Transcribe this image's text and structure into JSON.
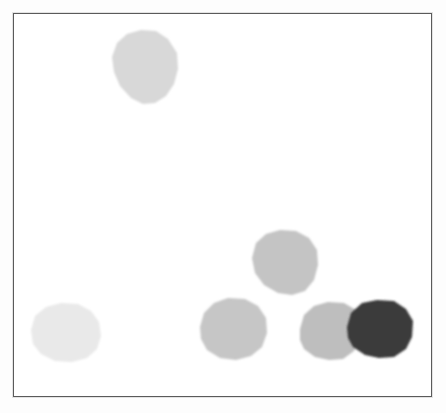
{
  "figure": {
    "type": "scanned-grayscale-particle-figure",
    "canvas": {
      "width": 446,
      "height": 413,
      "background": "#ffffff"
    },
    "frame": {
      "name": "plot-border",
      "x": 13,
      "y": 13,
      "width": 419,
      "height": 384,
      "border_color": "#5a5a5a",
      "border_width_px": 1.5,
      "fill": "#ffffff"
    },
    "palette": {
      "lightest": "#eaeaea",
      "light": "#d9d9d9",
      "medium_light": "#cfcfcf",
      "medium": "#c4c4c4",
      "dark": "#3a3a3a",
      "frame": "#5a5a5a",
      "paper": "#fdfdfd"
    }
  },
  "chart_data": {
    "type": "scatter",
    "title": "",
    "subtitle": "",
    "xlabel": "",
    "ylabel": "",
    "grid": false,
    "legend": null,
    "axis_ticks": [],
    "annotations": [],
    "xlim": [
      13,
      432
    ],
    "ylim": [
      13,
      397
    ],
    "objects": [
      {
        "id": "particle-1",
        "label": "top-light-particle",
        "cx": 145,
        "cy": 67,
        "rx": 34,
        "ry": 37,
        "gray_value": 216,
        "color": "#d8d8d8",
        "points": "112,57 117,43 127,34 141,30 156,31 168,39 177,53 178,69 174,84 166,96 155,103 143,104 131,98 120,86 114,72"
      },
      {
        "id": "particle-2",
        "label": "bottom-left-lightest-particle",
        "cx": 66,
        "cy": 332,
        "rx": 35,
        "ry": 30,
        "gray_value": 233,
        "color": "#e9e9e9",
        "points": "31,330 35,316 46,307 61,303 78,304 91,311 99,322 101,336 97,349 87,358 72,362 55,361 41,354 33,344"
      },
      {
        "id": "particle-3",
        "label": "upper-middle-gray-particle",
        "cx": 285,
        "cy": 262,
        "rx": 33,
        "ry": 33,
        "gray_value": 196,
        "color": "#c4c4c4",
        "points": "252,258 256,243 266,234 280,230 296,231 309,238 317,250 318,265 314,280 305,291 292,295 278,293 264,285 255,273"
      },
      {
        "id": "particle-4",
        "label": "lower-middle-gray-particle",
        "cx": 233,
        "cy": 329,
        "rx": 33,
        "ry": 31,
        "gray_value": 198,
        "color": "#c6c6c6",
        "points": "200,327 204,313 214,303 228,298 245,299 258,306 266,318 267,333 262,347 251,356 236,360 220,358 207,350 201,339"
      },
      {
        "id": "particle-5",
        "label": "right-gray-particle",
        "cx": 330,
        "cy": 331,
        "rx": 30,
        "ry": 29,
        "gray_value": 190,
        "color": "#bebebe",
        "points": "300,329 304,315 314,306 328,302 344,303 356,310 360,323 359,339 354,351 343,359 329,360 315,357 304,349 300,340"
      },
      {
        "id": "particle-6",
        "label": "dark-particle",
        "cx": 380,
        "cy": 329,
        "rx": 33,
        "ry": 29,
        "gray_value": 58,
        "color": "#3a3a3a",
        "points": "347,327 351,313 362,303 377,300 394,301 406,309 413,321 412,337 406,349 394,357 379,358 365,355 353,347 348,338"
      }
    ]
  }
}
